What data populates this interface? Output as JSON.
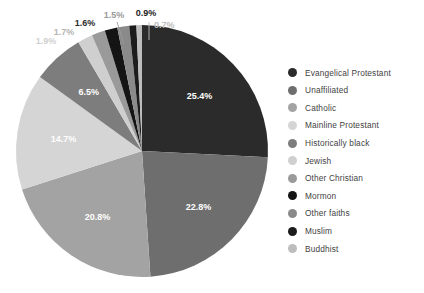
{
  "chart_data": {
    "type": "pie",
    "title": "",
    "subtitle": "",
    "legend_position": "right",
    "grid": false,
    "start_angle_deg": 0,
    "direction": "clockwise",
    "units": "percent",
    "categories": [
      "Evangelical Protestant",
      "Unaffiliated",
      "Catholic",
      "Mainline Protestant",
      "Historically black",
      "Jewish",
      "Other Christian",
      "Mormon",
      "Other faiths",
      "Muslim",
      "Buddhist"
    ],
    "values": [
      25.4,
      22.8,
      20.8,
      14.7,
      6.5,
      1.9,
      1.7,
      1.6,
      1.5,
      0.9,
      0.7
    ],
    "labels": [
      "25.4%",
      "22.8%",
      "20.8%",
      "14.7%",
      "6.5%",
      "1.9%",
      "1.7%",
      "1.6%",
      "1.5%",
      "0.9%",
      "0.7%"
    ],
    "colors": [
      "#2b2b2b",
      "#6e6e6e",
      "#a3a3a3",
      "#d5d5d5",
      "#7d7d7d",
      "#cfcfcf",
      "#9a9a9a",
      "#141414",
      "#8a8a8a",
      "#1c1c1c",
      "#bdbdbd"
    ],
    "label_colors": [
      "#ffffff",
      "#ffffff",
      "#ffffff",
      "#ffffff",
      "#ffffff",
      "#cfcfcf",
      "#b4b4b4",
      "#2b2b2b",
      "#9a9a9a",
      "#1c1c1c",
      "#bdbdbd"
    ],
    "label_placement": [
      "inside",
      "inside",
      "inside",
      "inside",
      "inside",
      "callout",
      "callout",
      "callout",
      "callout",
      "callout",
      "callout"
    ]
  },
  "legend": {
    "items": [
      {
        "label": "Evangelical Protestant",
        "color": "#2b2b2b"
      },
      {
        "label": "Unaffiliated",
        "color": "#6e6e6e"
      },
      {
        "label": "Catholic",
        "color": "#a3a3a3"
      },
      {
        "label": "Mainline Protestant",
        "color": "#d5d5d5"
      },
      {
        "label": "Historically black",
        "color": "#7d7d7d"
      },
      {
        "label": "Jewish",
        "color": "#cfcfcf"
      },
      {
        "label": "Other Christian",
        "color": "#9a9a9a"
      },
      {
        "label": "Mormon",
        "color": "#141414"
      },
      {
        "label": "Other faiths",
        "color": "#8a8a8a"
      },
      {
        "label": "Muslim",
        "color": "#1c1c1c"
      },
      {
        "label": "Buddhist",
        "color": "#bdbdbd"
      }
    ]
  },
  "geometry": {
    "cx": 142,
    "cy": 151,
    "r": 126
  },
  "callouts": [
    {
      "index": 5,
      "text": "1.9%",
      "tx": 46,
      "ty": 44,
      "anchor": "middle",
      "lx1": null,
      "ly1": null,
      "lx2": null,
      "ly2": null
    },
    {
      "index": 6,
      "text": "1.7%",
      "tx": 64,
      "ty": 35,
      "anchor": "middle",
      "lx1": null,
      "ly1": null,
      "lx2": null,
      "ly2": null
    },
    {
      "index": 7,
      "text": "1.6%",
      "tx": 85,
      "ty": 26,
      "anchor": "middle",
      "lx1": null,
      "ly1": null,
      "lx2": null,
      "ly2": null
    },
    {
      "index": 8,
      "text": "1.5%",
      "tx": 114,
      "ty": 18,
      "anchor": "middle",
      "lx1": 117,
      "ly1": 22,
      "lx2": 124,
      "ly2": 44
    },
    {
      "index": 9,
      "text": "0.9%",
      "tx": 146,
      "ty": 16,
      "anchor": "middle",
      "lx1": null,
      "ly1": null,
      "lx2": null,
      "ly2": null
    },
    {
      "index": 10,
      "text": "0.7%",
      "tx": 154,
      "ty": 28,
      "anchor": "start",
      "lx1": 149,
      "ly1": 22,
      "lx2": 149,
      "ly2": 40
    }
  ]
}
